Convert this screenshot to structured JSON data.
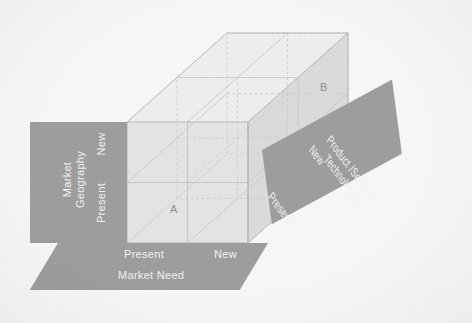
{
  "diagram": {
    "type": "3d-matrix-cube",
    "divisions": 2,
    "colors": {
      "background": "#f6f6f5",
      "panel_fill": "#9d9d9d",
      "panel_text": "#f2f2f2",
      "cube_front": "#e2e2e0",
      "cube_top": "#eaeae8",
      "cube_side": "#d9d9d7",
      "grid_line": "#b9b9b7",
      "marker_text": "#8e8e8e"
    }
  },
  "axes": {
    "vertical": {
      "id": "market-geography",
      "title": "Market\nGeography",
      "title_line1": "Market",
      "title_line2": "Geography",
      "ticks": [
        "New",
        "Present"
      ],
      "tick_low": "Present",
      "tick_high": "New"
    },
    "horizontal": {
      "id": "market-need",
      "title": "Market Need",
      "ticks": [
        "Present",
        "New"
      ],
      "tick_low": "Present",
      "tick_high": "New"
    },
    "depth": {
      "id": "product-services-technologies",
      "title_line1": "Product /Services",
      "title_line2": "Technologies",
      "ticks": [
        "Present",
        "New"
      ],
      "tick_low": "Present",
      "tick_high": "New"
    }
  },
  "markers": [
    {
      "label": "A",
      "position": "front-bottom-left cell (Market Need: Present, Geography: Present, Product: Present)"
    },
    {
      "label": "B",
      "position": "rear-upper-right cell (Market Need: New, Geography: New, Product: New)"
    }
  ]
}
